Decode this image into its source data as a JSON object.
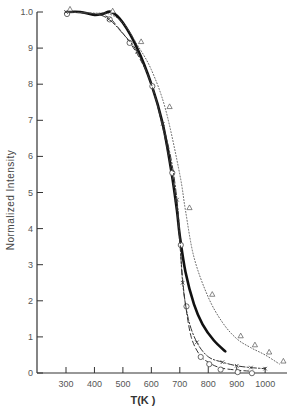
{
  "chart_data": {
    "type": "line",
    "title": "",
    "xlabel": "T(K )",
    "ylabel": "Normalized  Intensity",
    "xlim": [
      200,
      1100
    ],
    "ylim": [
      0,
      10
    ],
    "x_ticks": [
      300,
      400,
      500,
      600,
      700,
      800,
      900,
      1000
    ],
    "x_tick_labels": [
      "300",
      "400",
      "500",
      "600",
      "700",
      "800",
      "900",
      "1000"
    ],
    "y_ticks": [
      0,
      1,
      2,
      3,
      4,
      5,
      6,
      7,
      8,
      9,
      10
    ],
    "y_tick_labels": [
      "0",
      "1",
      "2",
      "3",
      "4",
      "5",
      "6",
      "7",
      "8",
      "9",
      "1.0"
    ],
    "grid": false,
    "legend": "none",
    "series": [
      {
        "name": "solid (thick)",
        "style": "solid-thick",
        "marker": "none",
        "x": [
          300,
          350,
          400,
          430,
          460,
          500,
          550,
          600,
          640,
          670,
          690,
          700,
          720,
          750,
          780,
          820,
          860
        ],
        "y": [
          10.0,
          10.0,
          9.92,
          9.95,
          10.0,
          9.7,
          9.0,
          8.0,
          6.9,
          5.6,
          4.5,
          3.8,
          2.8,
          1.9,
          1.35,
          0.9,
          0.6
        ]
      },
      {
        "name": "dashed (circles)",
        "style": "dashed",
        "marker": "circle",
        "x": [
          300,
          400,
          450,
          480,
          520,
          560,
          600,
          640,
          670,
          690,
          700,
          710,
          720,
          740,
          770,
          800,
          840,
          900,
          950
        ],
        "y": [
          10.0,
          9.95,
          9.85,
          9.6,
          9.2,
          8.7,
          8.0,
          6.8,
          5.6,
          4.5,
          3.6,
          2.6,
          1.9,
          1.0,
          0.5,
          0.3,
          0.15,
          0.08,
          0.05
        ]
      },
      {
        "name": "dash-dot (crosses)",
        "style": "dash-dot",
        "marker": "x",
        "x": [
          300,
          400,
          450,
          500,
          550,
          600,
          640,
          670,
          690,
          700,
          710,
          730,
          760,
          800,
          850,
          900,
          950,
          1000
        ],
        "y": [
          10.0,
          9.95,
          9.8,
          9.4,
          8.9,
          8.0,
          6.9,
          5.9,
          4.8,
          3.8,
          2.5,
          1.5,
          0.85,
          0.45,
          0.3,
          0.2,
          0.15,
          0.12
        ]
      },
      {
        "name": "dotted (triangles)",
        "style": "dotted",
        "marker": "triangle",
        "x": [
          300,
          400,
          450,
          500,
          550,
          600,
          650,
          700,
          720,
          750,
          800,
          850,
          900,
          950,
          1000,
          1050
        ],
        "y": [
          10.0,
          9.97,
          9.95,
          9.7,
          9.1,
          8.4,
          7.3,
          5.5,
          4.5,
          3.2,
          2.1,
          1.4,
          0.95,
          0.7,
          0.5,
          0.25
        ]
      }
    ],
    "annotations": []
  }
}
